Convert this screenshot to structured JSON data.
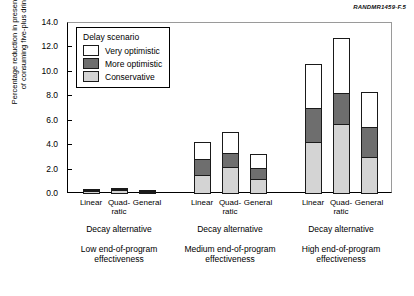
{
  "figure_id": "RANDMR1459-F.5",
  "axis": {
    "y_title": "Percentage reduction in present value\nof consuming five-plus drinks",
    "y_ticks": [
      "0.0",
      "2.0",
      "4.0",
      "6.0",
      "8.0",
      "10.0",
      "12.0",
      "14.0"
    ]
  },
  "legend": {
    "title": "Delay scenario",
    "items": [
      {
        "label": "Very optimistic",
        "key": "very",
        "color": "#ffffff"
      },
      {
        "label": "More optimistic",
        "key": "more",
        "color": "#6e6e6e"
      },
      {
        "label": "Conservative",
        "key": "cons",
        "color": "#d4d4d4"
      }
    ]
  },
  "groups": [
    {
      "axis_label": "Decay alternative",
      "caption": "Low end-of-program\neffectiveness",
      "categories": [
        "Linear",
        "Quad-\nratic",
        "General"
      ]
    },
    {
      "axis_label": "Decay alternative",
      "caption": "Medium end-of-program\neffectiveness",
      "categories": [
        "Linear",
        "Quad-\nratic",
        "General"
      ]
    },
    {
      "axis_label": "Decay alternative",
      "caption": "High end-of-program\neffectiveness",
      "categories": [
        "Linear",
        "Quad-\nratic",
        "General"
      ]
    }
  ],
  "chart_data": {
    "type": "bar",
    "stacked": true,
    "title": "",
    "xlabel": "Decay alternative",
    "ylabel": "Percentage reduction in present value of consuming five-plus drinks",
    "ylim": [
      0.0,
      14.0
    ],
    "ytick_step": 2.0,
    "grid": false,
    "legend_position": "upper-left-inside",
    "categories": [
      "Low / Linear",
      "Low / Quadratic",
      "Low / General",
      "Medium / Linear",
      "Medium / Quadratic",
      "Medium / General",
      "High / Linear",
      "High / Quadratic",
      "High / General"
    ],
    "series": [
      {
        "name": "Conservative",
        "color": "#d4d4d4",
        "values": [
          0.22,
          0.3,
          0.18,
          1.6,
          2.25,
          1.2,
          4.25,
          5.7,
          3.0
        ]
      },
      {
        "name": "More optimistic",
        "color": "#6e6e6e",
        "values": [
          0.18,
          0.2,
          0.12,
          1.4,
          1.2,
          1.05,
          2.9,
          2.7,
          2.6
        ]
      },
      {
        "name": "Very optimistic",
        "color": "#ffffff",
        "values": [
          0.1,
          0.15,
          0.1,
          1.45,
          1.85,
          1.2,
          3.65,
          4.55,
          2.9
        ]
      }
    ],
    "cumulative_totals": [
      0.5,
      0.65,
      0.4,
      4.45,
      5.3,
      3.45,
      10.8,
      12.95,
      8.5
    ]
  }
}
